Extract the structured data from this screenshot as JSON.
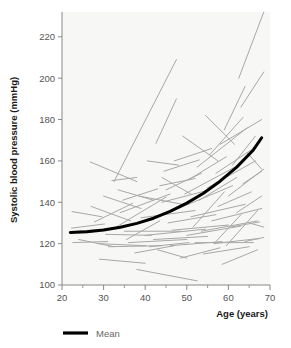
{
  "chart_data": {
    "type": "line",
    "title": "",
    "xlabel": "Age (years)",
    "ylabel": "Systolic blood pressure (mmHg)",
    "xlim": [
      20,
      70
    ],
    "ylim": [
      100,
      232
    ],
    "xticks": [
      20,
      30,
      40,
      50,
      60,
      70
    ],
    "xtick_labels": [
      "20",
      "30",
      "40",
      "50",
      "60",
      "70"
    ],
    "xminor_ticks": [
      25,
      35,
      45,
      55,
      65
    ],
    "yticks": [
      100,
      120,
      140,
      160,
      180,
      200,
      220
    ],
    "ytick_labels": [
      "100",
      "120",
      "140",
      "160",
      "180",
      "200",
      "220"
    ],
    "grid": false,
    "legend_position": "below-left",
    "legend": [
      {
        "name": "Mean",
        "style": "thick-black-line",
        "color": "#000000"
      }
    ],
    "plot_background": "#f7f7f5",
    "series": [
      {
        "name": "Mean",
        "kind": "mean-curve",
        "color": "#000000",
        "linewidth": 3,
        "x": [
          22,
          26,
          30,
          34,
          38,
          42,
          46,
          50,
          54,
          58,
          62,
          66,
          68
        ],
        "values": [
          125.4,
          125.8,
          126.6,
          127.9,
          129.8,
          132.3,
          135.6,
          139.6,
          144.4,
          150.2,
          157.0,
          165.3,
          171.2
        ]
      },
      {
        "name": "Individual subjects",
        "kind": "spaghetti-segments",
        "color": "#a8a8a8",
        "linewidth": 1,
        "segments": [
          {
            "x": [
              22.4,
              29.6
            ],
            "y": [
              135.5,
              133.0
            ]
          },
          {
            "x": [
              22.3,
              30.2
            ],
            "y": [
              127.5,
              129.5
            ]
          },
          {
            "x": [
              22.6,
              31.0
            ],
            "y": [
              120.5,
              121.0
            ]
          },
          {
            "x": [
              23.4,
              33.8
            ],
            "y": [
              126.0,
              127.5
            ]
          },
          {
            "x": [
              24.0,
              32.5
            ],
            "y": [
              122.0,
              118.5
            ]
          },
          {
            "x": [
              26.8,
              38.0
            ],
            "y": [
              159.5,
              150.0
            ]
          },
          {
            "x": [
              27.0,
              36.5
            ],
            "y": [
              138.0,
              131.0
            ]
          },
          {
            "x": [
              27.8,
              37.0
            ],
            "y": [
              130.5,
              139.5
            ]
          },
          {
            "x": [
              28.5,
              40.2
            ],
            "y": [
              120.0,
              119.0
            ]
          },
          {
            "x": [
              29.0,
              40.0
            ],
            "y": [
              112.5,
              110.5
            ]
          },
          {
            "x": [
              30.5,
              41.5
            ],
            "y": [
              124.5,
              124.0
            ]
          },
          {
            "x": [
              31.2,
              44.0
            ],
            "y": [
              118.5,
              119.0
            ]
          },
          {
            "x": [
              32.0,
              38.0
            ],
            "y": [
              150.5,
              152.0
            ]
          },
          {
            "x": [
              32.5,
              47.5
            ],
            "y": [
              150.0,
              209.0
            ]
          },
          {
            "x": [
              33.0,
              45.0
            ],
            "y": [
              128.0,
              142.5
            ]
          },
          {
            "x": [
              34.0,
              46.0
            ],
            "y": [
              135.0,
              144.0
            ]
          },
          {
            "x": [
              34.6,
              43.0
            ],
            "y": [
              141.0,
              146.5
            ]
          },
          {
            "x": [
              35.0,
              48.5
            ],
            "y": [
              126.0,
              126.0
            ]
          },
          {
            "x": [
              36.0,
              50.0
            ],
            "y": [
              120.5,
              122.0
            ]
          },
          {
            "x": [
              37.5,
              47.0
            ],
            "y": [
              115.5,
              119.0
            ]
          },
          {
            "x": [
              38.0,
              52.5
            ],
            "y": [
              107.5,
              102.0
            ]
          },
          {
            "x": [
              38.5,
              49.0
            ],
            "y": [
              143.0,
              139.0
            ]
          },
          {
            "x": [
              39.0,
              52.0
            ],
            "y": [
              132.5,
              136.0
            ]
          },
          {
            "x": [
              40.0,
              54.5
            ],
            "y": [
              124.0,
              127.0
            ]
          },
          {
            "x": [
              41.0,
              50.5
            ],
            "y": [
              118.5,
              120.5
            ]
          },
          {
            "x": [
              42.0,
              55.0
            ],
            "y": [
              122.0,
              123.5
            ]
          },
          {
            "x": [
              42.6,
              47.5
            ],
            "y": [
              168.5,
              190.0
            ]
          },
          {
            "x": [
              43.5,
              52.0
            ],
            "y": [
              148.0,
              151.5
            ]
          },
          {
            "x": [
              44.0,
              55.5
            ],
            "y": [
              140.0,
              146.0
            ]
          },
          {
            "x": [
              44.5,
              53.0
            ],
            "y": [
              155.0,
              160.5
            ]
          },
          {
            "x": [
              45.5,
              57.0
            ],
            "y": [
              130.0,
              134.0
            ]
          },
          {
            "x": [
              46.0,
              58.5
            ],
            "y": [
              119.0,
              121.0
            ]
          },
          {
            "x": [
              46.5,
              60.0
            ],
            "y": [
              126.5,
              129.0
            ]
          },
          {
            "x": [
              47.0,
              56.0
            ],
            "y": [
              160.0,
              166.0
            ]
          },
          {
            "x": [
              48.0,
              61.0
            ],
            "y": [
              137.0,
              148.0
            ]
          },
          {
            "x": [
              48.5,
              58.0
            ],
            "y": [
              113.0,
              118.0
            ]
          },
          {
            "x": [
              49.5,
              62.5
            ],
            "y": [
              144.0,
              158.0
            ]
          },
          {
            "x": [
              50.0,
              63.0
            ],
            "y": [
              124.0,
              128.5
            ]
          },
          {
            "x": [
              50.5,
              59.5
            ],
            "y": [
              151.0,
              162.0
            ]
          },
          {
            "x": [
              51.0,
              64.0
            ],
            "y": [
              133.0,
              139.0
            ]
          },
          {
            "x": [
              52.0,
              66.0
            ],
            "y": [
              120.5,
              120.5
            ]
          },
          {
            "x": [
              52.5,
              64.5
            ],
            "y": [
              157.0,
              176.0
            ]
          },
          {
            "x": [
              53.0,
              62.0
            ],
            "y": [
              141.0,
              152.0
            ]
          },
          {
            "x": [
              53.5,
              67.0
            ],
            "y": [
              126.0,
              131.0
            ]
          },
          {
            "x": [
              54.0,
              65.0
            ],
            "y": [
              115.0,
              118.5
            ]
          },
          {
            "x": [
              55.0,
              66.5
            ],
            "y": [
              147.0,
              160.0
            ]
          },
          {
            "x": [
              55.5,
              63.5
            ],
            "y": [
              163.0,
              181.0
            ]
          },
          {
            "x": [
              56.0,
              68.0
            ],
            "y": [
              131.0,
              137.0
            ]
          },
          {
            "x": [
              56.5,
              67.5
            ],
            "y": [
              120.0,
              122.5
            ]
          },
          {
            "x": [
              57.0,
              66.0
            ],
            "y": [
              154.0,
              166.0
            ]
          },
          {
            "x": [
              57.5,
              65.5
            ],
            "y": [
              138.0,
              145.0
            ]
          },
          {
            "x": [
              58.0,
              68.0
            ],
            "y": [
              168.0,
              180.0
            ]
          },
          {
            "x": [
              58.5,
              67.0
            ],
            "y": [
              110.0,
              117.0
            ]
          },
          {
            "x": [
              59.0,
              64.0
            ],
            "y": [
              175.0,
              196.0
            ]
          },
          {
            "x": [
              60.0,
              68.5
            ],
            "y": [
              143.0,
              156.0
            ]
          },
          {
            "x": [
              60.5,
              67.5
            ],
            "y": [
              128.0,
              130.5
            ]
          },
          {
            "x": [
              61.0,
              66.5
            ],
            "y": [
              158.0,
              172.0
            ]
          },
          {
            "x": [
              62.0,
              68.0
            ],
            "y": [
              135.0,
              143.0
            ]
          },
          {
            "x": [
              62.5,
              68.5
            ],
            "y": [
              200.0,
              232.0
            ]
          },
          {
            "x": [
              63.0,
              68.5
            ],
            "y": [
              186.0,
              203.0
            ]
          },
          {
            "x": [
              63.5,
              68.0
            ],
            "y": [
              149.0,
              155.0
            ]
          },
          {
            "x": [
              64.0,
              68.5
            ],
            "y": [
              121.0,
              123.0
            ]
          },
          {
            "x": [
              64.5,
              68.0
            ],
            "y": [
              164.0,
              156.0
            ]
          },
          {
            "x": [
              65.0,
              68.5
            ],
            "y": [
              130.0,
              128.0
            ]
          },
          {
            "x": [
              44.0,
              51.0
            ],
            "y": [
              152.0,
              144.0
            ]
          },
          {
            "x": [
              45.0,
              53.5
            ],
            "y": [
              146.0,
              154.0
            ]
          },
          {
            "x": [
              49.0,
              57.5
            ],
            "y": [
              172.0,
              160.0
            ]
          },
          {
            "x": [
              51.5,
              59.0
            ],
            "y": [
              128.0,
              145.0
            ]
          },
          {
            "x": [
              40.5,
              48.0
            ],
            "y": [
              160.0,
              158.0
            ]
          },
          {
            "x": [
              35.5,
              43.5
            ],
            "y": [
              122.0,
              131.0
            ]
          },
          {
            "x": [
              30.0,
              39.0
            ],
            "y": [
              143.0,
              137.0
            ]
          },
          {
            "x": [
              54.5,
              61.5
            ],
            "y": [
              182.0,
              168.0
            ]
          },
          {
            "x": [
              57.0,
              63.0
            ],
            "y": [
              121.0,
              134.0
            ]
          },
          {
            "x": [
              59.5,
              67.0
            ],
            "y": [
              119.0,
              136.0
            ]
          },
          {
            "x": [
              43.0,
              50.0
            ],
            "y": [
              117.0,
              113.0
            ]
          },
          {
            "x": [
              33.5,
              42.0
            ],
            "y": [
              146.0,
              141.0
            ]
          }
        ]
      }
    ]
  }
}
